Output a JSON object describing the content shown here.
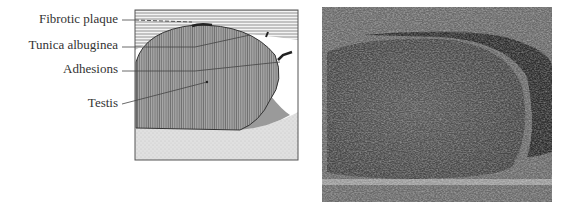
{
  "figure": {
    "diagram": {
      "labels": [
        {
          "id": "fibrotic-plaque",
          "text": "Fibrotic plaque"
        },
        {
          "id": "tunica-albuginea",
          "text": "Tunica albuginea"
        },
        {
          "id": "adhesions",
          "text": "Adhesions"
        },
        {
          "id": "testis",
          "text": "Testis"
        }
      ]
    },
    "ultrasound": {
      "description": "Ultrasound image of testis"
    },
    "colors": {
      "text": "#333333",
      "line": "#444444",
      "testis_fill": "#9a9a9a",
      "bottom_fill": "#dcdcdc",
      "ultrasound_bg": "#4a4a4a"
    }
  }
}
